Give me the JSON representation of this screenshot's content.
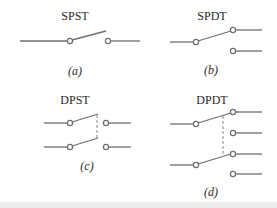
{
  "figure": {
    "panels": [
      {
        "id": "a",
        "title": "SPST",
        "caption": "(a)",
        "description": "single-pole single-throw switch"
      },
      {
        "id": "b",
        "title": "SPDT",
        "caption": "(b)",
        "description": "single-pole double-throw switch"
      },
      {
        "id": "c",
        "title": "DPST",
        "caption": "(c)",
        "description": "double-pole single-throw switch"
      },
      {
        "id": "d",
        "title": "DPDT",
        "caption": "(d)",
        "description": "double-pole double-throw switch"
      }
    ],
    "colors": {
      "wire": "#6e6e6e",
      "mechanical_link": "#8a8a8a",
      "text": "#2a2a2a",
      "background": "#ffffff"
    }
  }
}
